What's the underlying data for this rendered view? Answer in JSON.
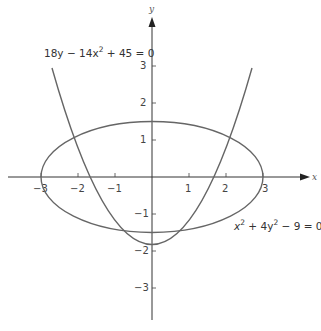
{
  "figure": {
    "axis_labels": {
      "x": "x",
      "y": "y"
    },
    "x_ticks": [
      {
        "value": -3,
        "label": "−3"
      },
      {
        "value": -2,
        "label": "−2"
      },
      {
        "value": -1,
        "label": "−1"
      },
      {
        "value": 1,
        "label": "1"
      },
      {
        "value": 2,
        "label": "2"
      },
      {
        "value": 3,
        "label": "3"
      }
    ],
    "y_ticks": [
      {
        "value": 3,
        "label": "3"
      },
      {
        "value": 2,
        "label": "2"
      },
      {
        "value": 1,
        "label": "1"
      },
      {
        "value": -1,
        "label": "−1"
      },
      {
        "value": -2,
        "label": "−2"
      },
      {
        "value": -3,
        "label": "−3"
      }
    ],
    "curves": [
      {
        "name": "parabola",
        "equation_parts": [
          "18y − 14x",
          "2",
          " + 45 = 0"
        ]
      },
      {
        "name": "ellipse",
        "equation_parts": [
          "x",
          "2",
          " + 4y",
          "2",
          " − 9 = 0"
        ]
      }
    ],
    "colors": {
      "curve": "#666666",
      "axis": "#333333"
    }
  }
}
